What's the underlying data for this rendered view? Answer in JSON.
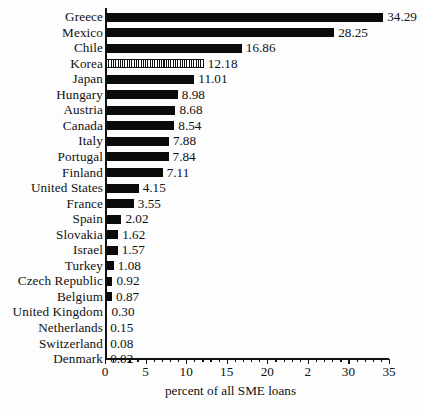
{
  "chart_data": {
    "type": "bar",
    "orientation": "horizontal",
    "title": "",
    "xlabel": "percent of all SME loans",
    "ylabel": "",
    "xlim": [
      0,
      35
    ],
    "grid": false,
    "legend": "none",
    "xticks": [
      0,
      5,
      10,
      15,
      20,
      25,
      30,
      35
    ],
    "xtick_labels": [
      "0",
      "5",
      "10",
      "15",
      "20",
      "2",
      "30",
      "35"
    ],
    "minor_tick_step": 1,
    "highlight_category": "Korea",
    "highlight_style": "vertical-hatch",
    "categories": [
      "Greece",
      "Mexico",
      "Chile",
      "Korea",
      "Japan",
      "Hungary",
      "Austria",
      "Canada",
      "Italy",
      "Portugal",
      "Finland",
      "United States",
      "France",
      "Spain",
      "Slovakia",
      "Israel",
      "Turkey",
      "Czech Republic",
      "Belgium",
      "United Kingdom",
      "Netherlands",
      "Switzerland",
      "Denmark"
    ],
    "values": [
      34.29,
      28.25,
      16.86,
      12.18,
      11.01,
      8.98,
      8.68,
      8.54,
      7.88,
      7.84,
      7.11,
      4.15,
      3.55,
      2.02,
      1.62,
      1.57,
      1.08,
      0.92,
      0.87,
      0.3,
      0.15,
      0.08,
      0.02
    ],
    "value_labels": [
      "34.29",
      "28.25",
      "16.86",
      "12.18",
      "11.01",
      "8.98",
      "8.68",
      "8.54",
      "7.88",
      "7.84",
      "7.11",
      "4.15",
      "3.55",
      "2.02",
      "1.62",
      "1.57",
      "1.08",
      "0.92",
      "0.87",
      "0.30",
      "0.15",
      "0.08",
      "0.02"
    ],
    "bar_color": "#0b0b0b",
    "highlight_color": "#111111",
    "background_color": "#fdfdfd"
  }
}
